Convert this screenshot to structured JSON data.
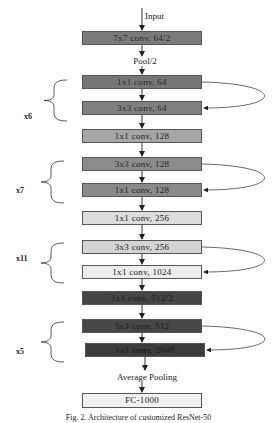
{
  "diagram": {
    "input_label": "Input",
    "pool_label": "Pool/2",
    "avgpool_label": "Average Pooling",
    "layers": [
      {
        "label": "7x7 conv, 64/2",
        "fill": "#7a7a7a",
        "text": "#2a2a2a"
      },
      {
        "label": "1x1 conv, 64",
        "fill": "#777777",
        "text": "#2a2a2a"
      },
      {
        "label": "3x3 conv, 64",
        "fill": "#808080",
        "text": "#2a2a2a"
      },
      {
        "label": "1x1 conv, 128",
        "fill": "#a6a6a6",
        "text": "#222222"
      },
      {
        "label": "3x3 conv, 128",
        "fill": "#8c8c8c",
        "text": "#222222"
      },
      {
        "label": "1x1 conv, 128",
        "fill": "#8a8a8a",
        "text": "#222222"
      },
      {
        "label": "1x1 conv, 256",
        "fill": "#dcdcdc",
        "text": "#222222"
      },
      {
        "label": "3x3 conv, 256",
        "fill": "#d4d4d4",
        "text": "#222222"
      },
      {
        "label": "1x1 conv, 1024",
        "fill": "#ececec",
        "text": "#222222"
      },
      {
        "label": "1x1 conv, 512/2",
        "fill": "#454545",
        "text": "#1a1a1a"
      },
      {
        "label": "3x3 conv, 512",
        "fill": "#474747",
        "text": "#1a1a1a"
      },
      {
        "label": "1x1 conv, 2048",
        "fill": "#3c3c3c",
        "text": "#1a1a1a"
      },
      {
        "label": "FC-1000",
        "fill": "#f0f0f0",
        "text": "#222222"
      }
    ],
    "repeats": [
      {
        "label": "x6"
      },
      {
        "label": "x7"
      },
      {
        "label": "x11"
      },
      {
        "label": "x5"
      }
    ],
    "caption": "Fig. 2. Architecture of customized ResNet-50"
  }
}
